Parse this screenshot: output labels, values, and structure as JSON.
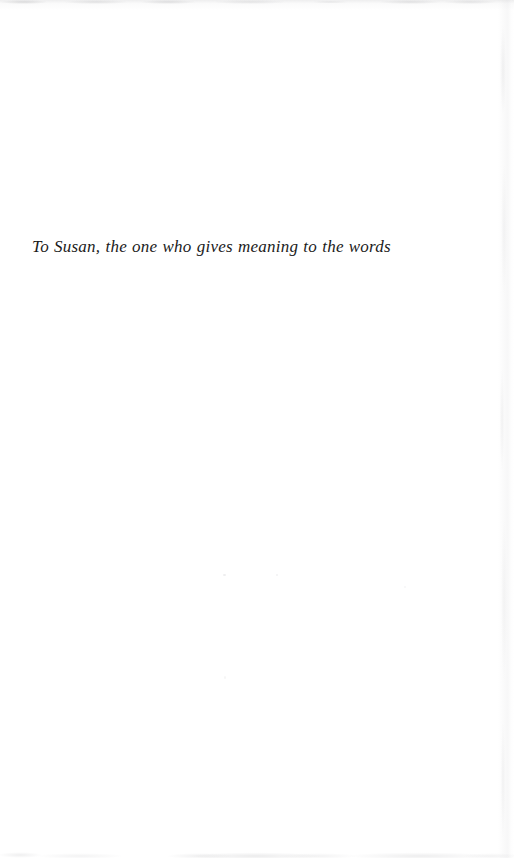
{
  "page": {
    "kind": "book-dedication-page",
    "background_color": "#ffffff",
    "width": 514,
    "height": 858
  },
  "dedication": {
    "text": "To Susan, the one who gives meaning to the words",
    "style": "italic-serif",
    "text_color": "#1b1b1b",
    "font_size_px": 17,
    "position": {
      "left_px": 32,
      "top_px": 236
    }
  },
  "artifacts": {
    "top_edge_label": "scan-artifact-top-edge",
    "bottom_edge_label": "scan-artifact-bottom-edge",
    "right_edge_label": "scan-artifact-right-edge",
    "edge_tint_color": "#b4b4b7"
  }
}
